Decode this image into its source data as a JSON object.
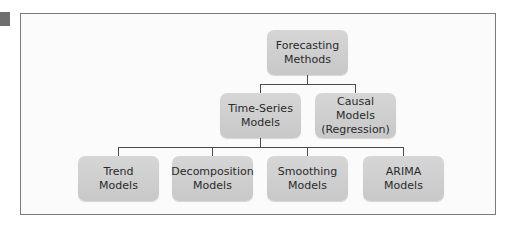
{
  "diagram": {
    "type": "tree",
    "root": {
      "label_line1": "Forecasting",
      "label_line2": "Methods"
    },
    "level1": [
      {
        "label_line1": "Time-Series",
        "label_line2": "Models"
      },
      {
        "label_line1": "Causal Models",
        "label_line2": "(Regression)"
      }
    ],
    "level2": [
      {
        "label_line1": "Trend",
        "label_line2": "Models"
      },
      {
        "label_line1": "Decomposition",
        "label_line2": "Models"
      },
      {
        "label_line1": "Smoothing",
        "label_line2": "Models"
      },
      {
        "label_line1": "ARIMA",
        "label_line2": "Models"
      }
    ],
    "edges": [
      [
        "Forecasting Methods",
        "Time-Series Models"
      ],
      [
        "Forecasting Methods",
        "Causal Models (Regression)"
      ],
      [
        "Time-Series Models",
        "Trend Models"
      ],
      [
        "Time-Series Models",
        "Decomposition Models"
      ],
      [
        "Time-Series Models",
        "Smoothing Models"
      ],
      [
        "Time-Series Models",
        "ARIMA Models"
      ]
    ],
    "colors": {
      "node_fill": "#cfcfcf",
      "line": "#4a4a4a",
      "frame_border": "#7a7a7a"
    }
  }
}
